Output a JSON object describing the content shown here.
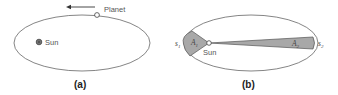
{
  "panel_a": {
    "planet_label": "Planet",
    "sun_label": "Sun",
    "caption": "(a)"
  },
  "panel_b": {
    "s1_label": "s",
    "s1_sub": "1",
    "a1_label": "A",
    "a1_sub": "1",
    "sun_label": "Sun",
    "a2_label": "A",
    "a2_sub": "2",
    "s2_label": "s",
    "s2_sub": "2",
    "caption": "(b)"
  },
  "colors": {
    "orbit": "#555555",
    "sector_fill": "#a8a8a8",
    "sun_fill": "#777777"
  }
}
